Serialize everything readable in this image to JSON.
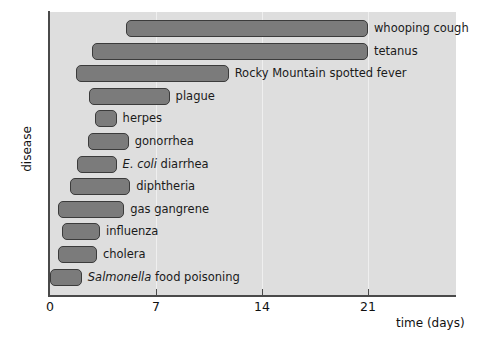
{
  "chart_data": {
    "type": "bar",
    "orientation": "horizontal",
    "bar_style": "floating-range",
    "title": "",
    "xlabel": "time (days)",
    "ylabel": "disease",
    "xlim": [
      0,
      26.9
    ],
    "x_ticks": [
      0,
      7,
      14,
      21
    ],
    "x_tick_labels": [
      "0",
      "7",
      "14",
      "21"
    ],
    "grid": "vertical-light",
    "legend": "none",
    "categories": [
      "whooping cough",
      "tetanus",
      "Rocky Mountain spotted fever",
      "plague",
      "herpes",
      "gonorrhea",
      "E. coli diarrhea",
      "diphtheria",
      "gas gangrene",
      "influenza",
      "cholera",
      "Salmonella food poisoning"
    ],
    "ranges": [
      {
        "label": "whooping cough",
        "start": 5.0,
        "end": 21.0,
        "italic_prefix": ""
      },
      {
        "label": "tetanus",
        "start": 2.8,
        "end": 21.0,
        "italic_prefix": ""
      },
      {
        "label": "Rocky Mountain spotted fever",
        "start": 1.7,
        "end": 11.8,
        "italic_prefix": ""
      },
      {
        "label": "plague",
        "start": 2.6,
        "end": 7.9,
        "italic_prefix": ""
      },
      {
        "label": "herpes",
        "start": 3.0,
        "end": 4.4,
        "italic_prefix": ""
      },
      {
        "label": "gonorrhea",
        "start": 2.5,
        "end": 5.2,
        "italic_prefix": ""
      },
      {
        "label": "diarrhea",
        "start": 1.8,
        "end": 4.4,
        "italic_prefix": "E. coli"
      },
      {
        "label": "diphtheria",
        "start": 1.3,
        "end": 5.3,
        "italic_prefix": ""
      },
      {
        "label": "gas gangrene",
        "start": 0.5,
        "end": 4.9,
        "italic_prefix": ""
      },
      {
        "label": "influenza",
        "start": 0.8,
        "end": 3.3,
        "italic_prefix": ""
      },
      {
        "label": "cholera",
        "start": 0.5,
        "end": 3.1,
        "italic_prefix": ""
      },
      {
        "label": "food poisoning",
        "start": 0.0,
        "end": 2.1,
        "italic_prefix": "Salmonella"
      }
    ],
    "colors": {
      "bar_fill": "#7b7b7b",
      "bar_border": "#3b3b3b",
      "panel_background": "#dedede",
      "gridline": "#efefef",
      "axis": "#4a4a4a",
      "text": "#111111",
      "page_background": "#ffffff"
    }
  },
  "axes": {
    "x_title": "time (days)",
    "y_title": "disease",
    "ticks": [
      {
        "value": 0,
        "label": "0"
      },
      {
        "value": 7,
        "label": "7"
      },
      {
        "value": 14,
        "label": "14"
      },
      {
        "value": 21,
        "label": "21"
      }
    ]
  }
}
